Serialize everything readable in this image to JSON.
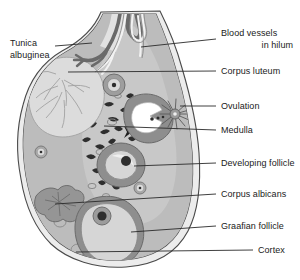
{
  "figure": {
    "type": "anatomical-diagram"
  },
  "labels": {
    "tunica_albuginea_line1": "Tunica",
    "tunica_albuginea_line2": "albuginea",
    "blood_vessels_line1": "Blood vessels",
    "blood_vessels_line2": "in hilum",
    "corpus_luteum": "Corpus luteum",
    "ovulation": "Ovulation",
    "medulla": "Medulla",
    "developing_follicle": "Developing follicle",
    "corpus_albicans": "Corpus albicans",
    "graafian_follicle": "Graafian follicle",
    "cortex": "Cortex"
  },
  "colors": {
    "background": "#ffffff",
    "outline": "#3a3a3a",
    "tunica_fill": "#e8e8e8",
    "cortex_fill": "#b9b9b9",
    "medulla_fill": "#c6c6c6",
    "corpus_luteum_fill": "#d8d8d8",
    "follicle_wall": "#8c8c8c",
    "follicle_interior": "#d4d4d4",
    "oocyte": "#3d3d3d",
    "corpus_albicans_fill": "#9a9a9a",
    "vessel_dark": "#6e6e6e",
    "vessel_light": "#ffffff",
    "ovum_white": "#ffffff",
    "leader_line": "#2a2a2a",
    "text": "#1a1a1a"
  },
  "structures": [
    {
      "name": "tunica-albuginea",
      "description": "thin outer capsule double line"
    },
    {
      "name": "blood-vessels-in-hilum",
      "description": "branching vessels entering at hilum"
    },
    {
      "name": "corpus-luteum",
      "description": "large pale body upper left"
    },
    {
      "name": "ovulation",
      "description": "ruptured follicle releasing ovum with burst"
    },
    {
      "name": "medulla",
      "description": "inner region with streaks and vessels"
    },
    {
      "name": "developing-follicle",
      "description": "mid-size follicle with antrum and oocyte"
    },
    {
      "name": "corpus-albicans",
      "description": "irregular scar body lower left"
    },
    {
      "name": "graafian-follicle",
      "description": "large mature follicle lower center"
    },
    {
      "name": "cortex",
      "description": "outer region containing follicles"
    }
  ]
}
